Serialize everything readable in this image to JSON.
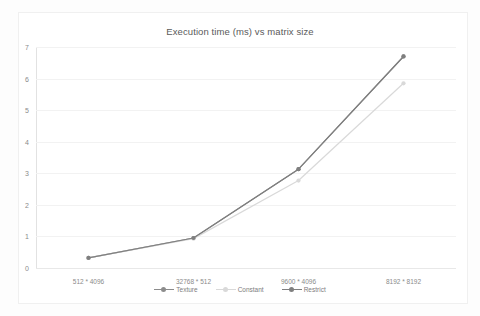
{
  "chart_data": {
    "type": "line",
    "title": "Execution time (ms) vs matrix size",
    "xlabel": "",
    "ylabel": "",
    "categories": [
      "512 * 4096",
      "32768 * 512",
      "9600 * 4096",
      "8192 * 8192"
    ],
    "series": [
      {
        "name": "Texture",
        "values": [
          0.32,
          0.95,
          3.13,
          6.7
        ],
        "color": "#8c8c8c"
      },
      {
        "name": "Constant",
        "values": [
          0.32,
          0.93,
          2.77,
          5.85
        ],
        "color": "#d9d9d9"
      },
      {
        "name": "Restrict",
        "values": [
          0.32,
          0.95,
          3.13,
          6.7
        ],
        "color": "#7f7f7f"
      }
    ],
    "ylim": [
      0,
      7
    ],
    "yticks": [
      0,
      1,
      2,
      3,
      4,
      5,
      6,
      7
    ],
    "ytick_labels": [
      "0",
      "1",
      "2",
      "3",
      "4",
      "5",
      "6",
      "7"
    ],
    "grid": true,
    "legend_position": "bottom",
    "marker": "circle"
  },
  "legend": {
    "items": [
      {
        "label": "Texture"
      },
      {
        "label": "Constant"
      },
      {
        "label": "Restrict"
      }
    ]
  }
}
